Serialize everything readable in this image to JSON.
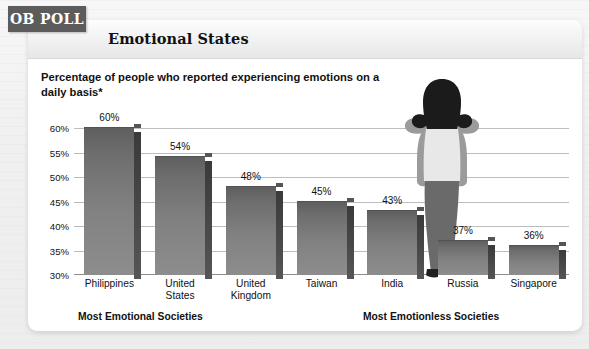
{
  "badge": {
    "label": "OB POLL"
  },
  "header": {
    "title": "Emotional States"
  },
  "subtitle": {
    "text": "Percentage of people who reported experiencing emotions on a daily basis*"
  },
  "groups": {
    "left_label": "Most Emotional Societies",
    "right_label": "Most Emotionless Societies"
  },
  "colors": {
    "badge_bg": "#5c5c5c",
    "bar_top": "#5f5f5f",
    "bar_bottom": "#8d8d8d",
    "bar_side": "#3a3a3a",
    "gridline": "#bdbdbd",
    "card_bg": "#ffffff",
    "page_bg": "#f2f2f2"
  },
  "illustration": {
    "name": "person-covering-ears",
    "hair_color": "#1b1b1b",
    "cardigan_color": "#9b9b9b",
    "top_color": "#e8e8e8",
    "jeans_color": "#6a6a6a",
    "shoe_color": "#1f1f1f"
  },
  "chart_data": {
    "type": "bar",
    "title": "Emotional States",
    "subtitle": "Percentage of people who reported experiencing emotions on a daily basis*",
    "xlabel": "",
    "ylabel": "",
    "categories": [
      "Philippines",
      "United States",
      "United Kingdom",
      "Taiwan",
      "India",
      "Russia",
      "Singapore"
    ],
    "values": [
      60,
      54,
      48,
      45,
      43,
      37,
      36
    ],
    "value_labels": [
      "60%",
      "54%",
      "48%",
      "45%",
      "43%",
      "37%",
      "36%"
    ],
    "ylim": [
      30,
      60
    ],
    "yticks": [
      60,
      55,
      50,
      45,
      40,
      35,
      30
    ],
    "ytick_labels": [
      "60%",
      "55%",
      "50%",
      "45%",
      "40%",
      "35%",
      "30%"
    ],
    "grid": true,
    "legend": "none",
    "annotations": [
      "Most Emotional Societies",
      "Most Emotionless Societies"
    ],
    "units": "percent"
  }
}
